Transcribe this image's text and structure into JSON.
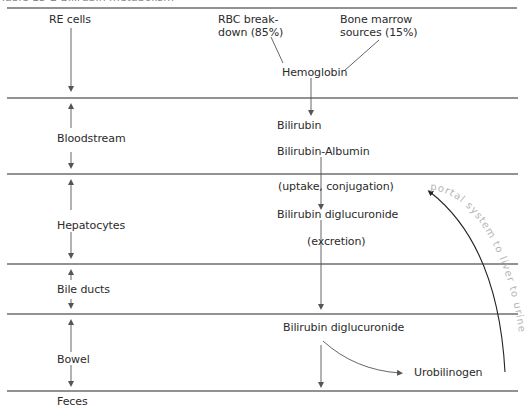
{
  "title": "Table 15-2 Bilirubin metabolism",
  "compartments": [
    {
      "id": "re-cells",
      "label": "RE cells"
    },
    {
      "id": "bloodstream",
      "label": "Bloodstream"
    },
    {
      "id": "hepatocytes",
      "label": "Hepatocytes"
    },
    {
      "id": "bile-ducts",
      "label": "Bile ducts"
    },
    {
      "id": "bowel",
      "label": "Bowel"
    },
    {
      "id": "feces",
      "label": "Feces"
    }
  ],
  "sources": {
    "rbc_line1": "RBC break-",
    "rbc_line2": "down (85%)",
    "marrow_line1": "Bone marrow",
    "marrow_line2": "sources (15%)"
  },
  "flow": {
    "hemoglobin": "Hemoglobin",
    "bilirubin": "Bilirubin",
    "bilirubin_albumin": "Bilirubin-Albumin",
    "uptake": "(uptake, conjugation)",
    "diglucuronide_liver": "Bilirubin diglucuronide",
    "excretion": "(excretion)",
    "diglucuronide_bowel": "Bilirubin diglucuronide",
    "urobilinogen": "Urobilinogen"
  },
  "handwritten_note": "portal system to liver to urine",
  "colors": {
    "rule": "#6e6e6e",
    "text": "#2b2b2b",
    "arrow": "#555555",
    "curve": "#222222",
    "note": "#b5b5b5"
  }
}
